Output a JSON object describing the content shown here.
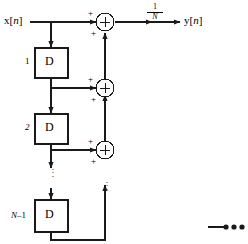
{
  "figure": {
    "stroke_color": "#1a1a1a",
    "background": "#ffffff",
    "input_label": "x[n]",
    "output_label": "y[n]",
    "gain_numerator": "1",
    "gain_denominator": "N",
    "vertical_ellipsis": "⋮"
  },
  "delays": [
    {
      "tap": "1",
      "symbol": "D"
    },
    {
      "tap": "2",
      "symbol": "D"
    },
    {
      "tap": "N–1",
      "symbol": "D"
    }
  ],
  "adders": [
    {
      "symbol": "+",
      "input_sign_top": "+",
      "input_sign_bottom": "+"
    },
    {
      "symbol": "+",
      "input_sign_top": "+",
      "input_sign_bottom": "+"
    },
    {
      "symbol": "+",
      "input_sign_top": "+",
      "input_sign_bottom": "+"
    }
  ],
  "corner_marks": {
    "dots": "•••"
  }
}
